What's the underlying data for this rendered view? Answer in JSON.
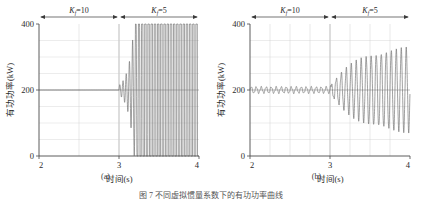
{
  "figure": {
    "caption": "图 7  不同虚拟惯量系数下的有功功率曲线",
    "panels": [
      {
        "id": "a",
        "sublabel": "(a)",
        "annotations": [
          {
            "name": "region-left",
            "text": "K",
            "subscript": "f",
            "suffix": "=10",
            "x_from": 2.0,
            "x_to": 3.0
          },
          {
            "name": "region-right",
            "text": "K",
            "subscript": "f",
            "suffix": "=5",
            "x_from": 3.0,
            "x_to": 4.0
          }
        ]
      },
      {
        "id": "b",
        "sublabel": "(b)",
        "annotations": [
          {
            "name": "region-left",
            "text": "K",
            "subscript": "f",
            "suffix": "=10",
            "x_from": 2.0,
            "x_to": 3.0
          },
          {
            "name": "region-right",
            "text": "K",
            "subscript": "f",
            "suffix": "=5",
            "x_from": 3.0,
            "x_to": 4.0
          }
        ]
      }
    ]
  },
  "chart_data": [
    {
      "type": "line",
      "id": "a",
      "title": "",
      "xlabel": "时间(s)",
      "ylabel": "有功功率(kW)",
      "xlim": [
        2,
        4
      ],
      "ylim": [
        0,
        400
      ],
      "xticks": [
        2,
        3,
        4
      ],
      "xticklabels": [
        "2",
        "3",
        "4"
      ],
      "yticks": [
        0,
        200,
        400
      ],
      "yticklabels": [
        "0",
        "200",
        "400"
      ],
      "x_minor_step": 0.5,
      "y_minor_step": 50,
      "grid": true,
      "legend": null,
      "series": [
        {
          "name": "有功功率",
          "color": "#6e6e6e",
          "description": "稳定在200 kW直至3.0 s，随后振荡发散并在约3.4 s后饱和于0～400 kW全幅振荡",
          "segments": {
            "steady_value": 200,
            "steady_until": 3.0,
            "growth_start": 3.0,
            "saturation_start": 3.42,
            "saturation_min": 0,
            "saturation_max": 400,
            "osc_frequency_hz": 25,
            "growth_rate": 14.0,
            "initial_amplitude": 14
          }
        }
      ]
    },
    {
      "type": "line",
      "id": "b",
      "title": "",
      "xlabel": "时间(s)",
      "ylabel": "有功功率(kW)",
      "xlim": [
        2,
        4
      ],
      "ylim": [
        0,
        400
      ],
      "xticks": [
        2,
        3,
        4
      ],
      "xticklabels": [
        "2",
        "3",
        "4"
      ],
      "yticks": [
        0,
        200,
        400
      ],
      "yticklabels": [
        "0",
        "200",
        "400"
      ],
      "x_minor_step": 0.25,
      "y_minor_step": 50,
      "grid": true,
      "legend": null,
      "series": [
        {
          "name": "有功功率",
          "color": "#6e6e6e",
          "description": "2～3 s在200 kW附近小幅纹波，3 s后振荡幅值逐渐增大至约±130 kW",
          "segments": {
            "steady_value": 200,
            "steady_until": 3.0,
            "ripple_amplitude": 11,
            "ripple_frequency_hz": 16,
            "growth_start": 3.0,
            "osc_frequency_hz": 16,
            "final_amplitude": 132,
            "growth_rate": 2.9,
            "envelope_limit": 140
          }
        }
      ]
    }
  ]
}
